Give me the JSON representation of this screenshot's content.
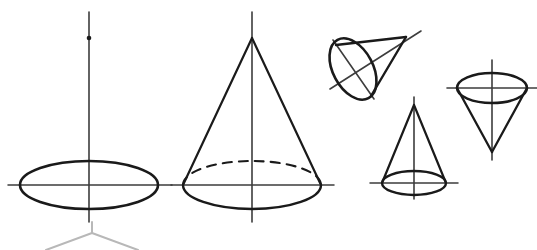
{
  "document": {
    "title": "Cone and Ellipse Geometric Figures",
    "background_color": "#ffffff",
    "stroke_color": "#1a1a1a",
    "axis_color": "#3d3d3d",
    "faint_color": "#b8b8b8",
    "width": 537,
    "height": 250
  },
  "figures": [
    {
      "id": "figure-1",
      "name": "ellipse-with-axes",
      "description": "Horizontal ellipse with vertical axis line through center and a marked point on the upper axis",
      "center": {
        "x": 89,
        "y": 185
      },
      "ellipse": {
        "rx": 69,
        "ry": 24
      },
      "vertical_axis": {
        "x": 89,
        "y_top": 12,
        "y_bottom": 222
      },
      "horizontal_axis": {
        "y": 185,
        "x_left": 8,
        "x_right": 172
      },
      "marked_point": {
        "x": 89,
        "y": 38
      },
      "stroke_width": 2.6
    },
    {
      "id": "figure-2",
      "name": "upright-cone-large",
      "description": "Large upright cone, apex at top, base ellipse with solid front arc and dashed hidden rear arc",
      "apex": {
        "x": 252,
        "y": 38
      },
      "base_center": {
        "x": 252,
        "y": 185
      },
      "ellipse": {
        "rx": 69,
        "ry": 24
      },
      "vertical_axis": {
        "x": 252,
        "y_top": 12,
        "y_bottom": 222
      },
      "horizontal_axis": {
        "y": 185,
        "x_left": 171,
        "x_right": 334
      },
      "hidden_edge_style": "dashed",
      "stroke_width": 2.2
    },
    {
      "id": "figure-3",
      "name": "tilted-cone",
      "description": "Oblique cone tilted with apex pointing to the upper right and elliptical base on the lower left, axis line extended through both ends",
      "apex": {
        "x": 406,
        "y": 37
      },
      "base_center": {
        "x": 353,
        "y": 69
      },
      "ellipse": {
        "rx": 33,
        "ry": 20,
        "rotation_deg": 62
      },
      "axis_line": {
        "x1": 330,
        "y1": 89,
        "x2": 421,
        "y2": 31
      },
      "base_diameter_line": {
        "x1": 333,
        "y1": 40,
        "x2": 373,
        "y2": 99
      },
      "stroke_width": 2.4
    },
    {
      "id": "figure-4",
      "name": "upright-cone-small",
      "description": "Small upright cone with apex at top and a flat base ellipse",
      "apex": {
        "x": 414,
        "y": 105
      },
      "base_center": {
        "x": 414,
        "y": 183
      },
      "ellipse": {
        "rx": 32,
        "ry": 12
      },
      "vertical_axis": {
        "x": 414,
        "y_top": 97,
        "y_bottom": 199
      },
      "horizontal_axis": {
        "y": 183,
        "x_left": 370,
        "x_right": 458
      },
      "stroke_width": 2.2
    },
    {
      "id": "figure-5",
      "name": "inverted-cone",
      "description": "Inverted cone with base ellipse at top and apex pointing downward",
      "apex": {
        "x": 492,
        "y": 152
      },
      "base_center": {
        "x": 492,
        "y": 88
      },
      "ellipse": {
        "rx": 35,
        "ry": 15
      },
      "vertical_axis": {
        "x": 492,
        "y_top": 60,
        "y_bottom": 160
      },
      "horizontal_axis": {
        "y": 88,
        "x_left": 447,
        "x_right": 537
      },
      "stroke_width": 2.3
    },
    {
      "id": "figure-6",
      "name": "partial-cone-cropped",
      "description": "Faint partially visible cone cropped by the bottom edge of the image, showing apex tip and two slant lines",
      "apex": {
        "x": 92,
        "y": 228
      },
      "left_slant": {
        "x1": 92,
        "y1": 232,
        "x2": 48,
        "y2": 250
      },
      "right_slant": {
        "x1": 92,
        "y1": 232,
        "x2": 136,
        "y2": 250
      },
      "stroke_width": 2.0
    }
  ]
}
